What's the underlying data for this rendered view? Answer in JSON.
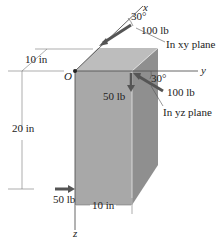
{
  "figure": {
    "axes": {
      "x": "x",
      "y": "y",
      "z": "z",
      "origin": "O"
    },
    "forces": {
      "xy_force": {
        "magnitude": "100 lb",
        "angle": "30°",
        "plane": "In xy plane"
      },
      "yz_force": {
        "magnitude": "100 lb",
        "angle": "30°",
        "plane": "In yz plane"
      },
      "down_force": {
        "magnitude": "50 lb"
      },
      "bottom_force": {
        "magnitude": "50 lb"
      }
    },
    "dimensions": {
      "depth": "10 in",
      "height": "20 in",
      "width": "10 in"
    },
    "colors": {
      "front_face": "#a6a6a6",
      "top_face": "#bdbdbd",
      "side_face": "#8e8e8e",
      "arrow": "#555555",
      "line": "#333333"
    }
  }
}
